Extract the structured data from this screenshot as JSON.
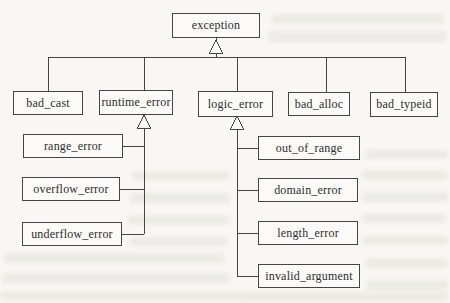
{
  "diagram": {
    "kind": "uml-class-inheritance-hierarchy",
    "edge_type": "inheritance (hollow triangle arrowhead points to base class)",
    "colors": {
      "paper": "#f8f7f3",
      "line": "#454545",
      "text": "#2e2e2e"
    },
    "nodes": {
      "exception": {
        "label": "exception"
      },
      "bad_cast": {
        "label": "bad_cast"
      },
      "runtime_error": {
        "label": "runtime_error"
      },
      "logic_error": {
        "label": "logic_error"
      },
      "bad_alloc": {
        "label": "bad_alloc"
      },
      "bad_typeid": {
        "label": "bad_typeid"
      },
      "range_error": {
        "label": "range_error"
      },
      "overflow_error": {
        "label": "overflow_error"
      },
      "underflow_error": {
        "label": "underflow_error"
      },
      "out_of_range": {
        "label": "out_of_range"
      },
      "domain_error": {
        "label": "domain_error"
      },
      "length_error": {
        "label": "length_error"
      },
      "invalid_argument": {
        "label": "invalid_argument"
      }
    },
    "edges": [
      {
        "from": "bad_cast",
        "to": "exception"
      },
      {
        "from": "runtime_error",
        "to": "exception"
      },
      {
        "from": "logic_error",
        "to": "exception"
      },
      {
        "from": "bad_alloc",
        "to": "exception"
      },
      {
        "from": "bad_typeid",
        "to": "exception"
      },
      {
        "from": "range_error",
        "to": "runtime_error"
      },
      {
        "from": "overflow_error",
        "to": "runtime_error"
      },
      {
        "from": "underflow_error",
        "to": "runtime_error"
      },
      {
        "from": "out_of_range",
        "to": "logic_error"
      },
      {
        "from": "domain_error",
        "to": "logic_error"
      },
      {
        "from": "length_error",
        "to": "logic_error"
      },
      {
        "from": "invalid_argument",
        "to": "logic_error"
      }
    ]
  }
}
